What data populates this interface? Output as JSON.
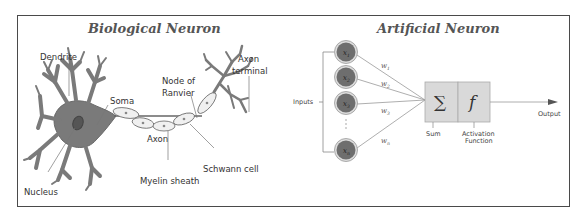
{
  "biological": {
    "title": "Biological Neuron",
    "labels": {
      "dendrite": "Dendrite",
      "soma": "Soma",
      "nucleus": "Nucleus",
      "axon": "Axon",
      "myelin_sheath": "Myelin sheath",
      "schwann_cell": "Schwann cell",
      "node_of_ranvier_1": "Node of",
      "node_of_ranvier_2": "Ranvier",
      "axon_terminal_1": "Axon",
      "axon_terminal_2": "terminal"
    }
  },
  "artificial": {
    "title": "Artificial Neuron",
    "inputs_label": "Inputs",
    "inputs": [
      {
        "symbol": "x",
        "sub": "1",
        "weight": "w",
        "weight_sub": "1"
      },
      {
        "symbol": "x",
        "sub": "2",
        "weight": "w",
        "weight_sub": "2"
      },
      {
        "symbol": "x",
        "sub": "3",
        "weight": "w",
        "weight_sub": "3"
      },
      {
        "symbol": "x",
        "sub": "n",
        "weight": "w",
        "weight_sub": "n"
      }
    ],
    "sum_symbol": "∑",
    "activation_symbol": "f",
    "sum_label": "Sum",
    "activation_label_1": "Activation",
    "activation_label_2": "Function",
    "output_label": "Output"
  },
  "colors": {
    "frame": "#4a4a4a",
    "neuron_fill": "#7a7a7a",
    "myelin_fill": "#f0f0f0",
    "node_fill": "#6e6e6e",
    "box_fill": "#d9d9d9",
    "line": "#888888"
  }
}
